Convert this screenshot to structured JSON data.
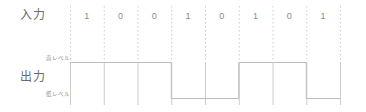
{
  "figure": {
    "input_label": "入力",
    "output_label": "出力",
    "high_level_label": "高レベル",
    "low_level_label": "低レベル",
    "line_color": "#bdbdbd",
    "grid_color": "#cccccc",
    "text_color": "#7a7a7a"
  },
  "chart_data": {
    "type": "line",
    "title": "",
    "xlabel": "",
    "ylabel": "",
    "grid": true,
    "legend": "none",
    "categories": [
      "1",
      "2",
      "3",
      "4",
      "5",
      "6",
      "7",
      "8"
    ],
    "bits": [
      "1",
      "0",
      "0",
      "1",
      "0",
      "1",
      "0",
      "1"
    ],
    "levels": [
      "high",
      "high",
      "high",
      "low",
      "low",
      "high",
      "high",
      "low"
    ],
    "level_values": [
      1,
      1,
      1,
      0,
      0,
      1,
      1,
      0
    ],
    "ylim": [
      0,
      1
    ],
    "ytick_labels": [
      "低レベル",
      "高レベル"
    ],
    "series": [
      {
        "name": "出力",
        "values": [
          1,
          1,
          1,
          0,
          0,
          1,
          1,
          0
        ]
      }
    ],
    "grid_x_positions": [
      70,
      103.75,
      137.5,
      171.25,
      205,
      238.75,
      272.5,
      306.25,
      340
    ],
    "high_y": 62,
    "low_y": 98
  }
}
